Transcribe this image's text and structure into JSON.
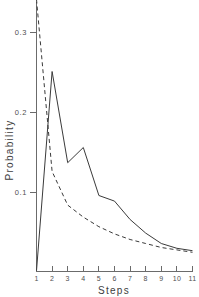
{
  "chart_data": {
    "type": "line",
    "title": "",
    "xlabel": "Steps",
    "ylabel": "Probability",
    "x": [
      1,
      2,
      3,
      4,
      5,
      6,
      7,
      8,
      9,
      10,
      11
    ],
    "xlim": [
      1,
      11
    ],
    "ylim": [
      0,
      0.34
    ],
    "grid": false,
    "legend_position": "none",
    "xtick_labels": [
      "1",
      "2",
      "3",
      "4",
      "5",
      "6",
      "7",
      "8",
      "9",
      "10",
      "11"
    ],
    "ytick_values": [
      0.1,
      0.2,
      0.3
    ],
    "ytick_labels": [
      "0.1",
      "0.2",
      "0.3"
    ],
    "series": [
      {
        "name": "solid",
        "style": "solid",
        "color": "#3a3a3a",
        "values": [
          0.001,
          0.25,
          0.136,
          0.155,
          0.095,
          0.088,
          0.065,
          0.048,
          0.035,
          0.029,
          0.026
        ]
      },
      {
        "name": "dashed",
        "style": "dashed",
        "color": "#3a3a3a",
        "values": [
          0.34,
          0.125,
          0.083,
          0.068,
          0.056,
          0.047,
          0.04,
          0.035,
          0.03,
          0.027,
          0.024
        ]
      }
    ]
  },
  "axes": {
    "y_title": "Probability",
    "x_title": "Steps"
  }
}
